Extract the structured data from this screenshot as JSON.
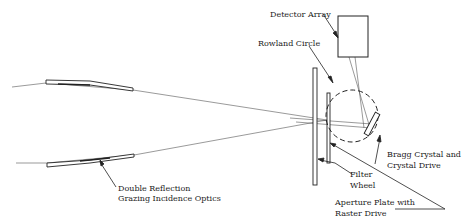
{
  "diagram": {
    "type": "x-ray spectrometer optical layout",
    "labels": {
      "detector_array": "Detector Array",
      "rowland_circle": "Rowland Circle",
      "bragg_crystal_line1": "Bragg Crystal and",
      "bragg_crystal_line2": "Crystal Drive",
      "filter_wheel_line1": "Filter",
      "filter_wheel_line2": "Wheel",
      "aperture_plate_line1": "Aperture Plate with",
      "aperture_plate_line2": "Raster Drive",
      "optics_line1": "Double Reflection",
      "optics_line2": "Grazing Incidence Optics"
    },
    "colors": {
      "line": "#222222",
      "ray": "#444444",
      "background": "#ffffff"
    }
  }
}
